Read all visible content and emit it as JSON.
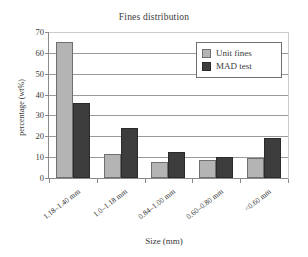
{
  "chart_data": {
    "type": "bar",
    "title": "Fines distribution",
    "xlabel": "Size (mm)",
    "ylabel": "percentage (wt%)",
    "categories": [
      "1.18–1.40 mm",
      "1.0–1.18 mm",
      "0.84–1.00 mm",
      "0.60–0.80 mm",
      "<0.60 mm"
    ],
    "series": [
      {
        "name": "Unit fines",
        "color": "#b4b4b4",
        "values": [
          65,
          11.5,
          7.5,
          8.5,
          9.5
        ]
      },
      {
        "name": "MAD test",
        "color": "#3d3d3d",
        "values": [
          36,
          24,
          12.5,
          10.3,
          19
        ]
      }
    ],
    "ylim": [
      0,
      70
    ],
    "yticks": [
      0,
      10,
      20,
      30,
      40,
      50,
      60,
      70
    ],
    "ytick_labels": [
      "0",
      "10",
      "20",
      "30",
      "40",
      "50",
      "60",
      "70"
    ],
    "grid": true,
    "legend_position": "top-right"
  }
}
